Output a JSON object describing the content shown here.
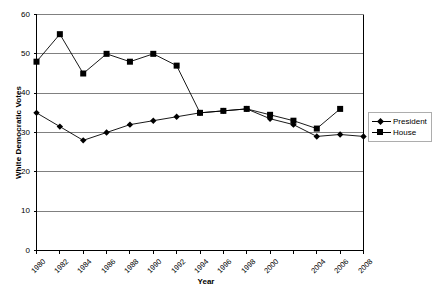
{
  "chart_data": {
    "type": "line",
    "title": "",
    "xlabel": "Year",
    "ylabel": "White Democratic Votes",
    "xlim": [
      1980,
      2008
    ],
    "ylim": [
      0,
      60
    ],
    "ytick_step": 10,
    "yticks": [
      0,
      10,
      20,
      30,
      40,
      50,
      60
    ],
    "grid": "horizontal",
    "legend_position": "right",
    "x": [
      1980,
      1982,
      1984,
      1986,
      1988,
      1990,
      1992,
      1994,
      1996,
      1998,
      2000,
      2002,
      2004,
      2006,
      2008
    ],
    "xticklabels": [
      "1980",
      "1982",
      "1984",
      "1986",
      "1988",
      "1990",
      "1992",
      "1994",
      "1996",
      "1998",
      "2000",
      "",
      "2004",
      "2006",
      "2008"
    ],
    "series": [
      {
        "name": "President",
        "marker": "diamond",
        "values": [
          35,
          31.5,
          28,
          30,
          32,
          33,
          34,
          35,
          35.5,
          36,
          33.5,
          32,
          29,
          29.5,
          29
        ]
      },
      {
        "name": "House",
        "marker": "square",
        "values": [
          48,
          55,
          45,
          50,
          48,
          50,
          47,
          35,
          35.5,
          36,
          34.5,
          33,
          31,
          36,
          null
        ]
      }
    ],
    "yticklabels": [
      "0",
      "10",
      "20",
      "30",
      "40",
      "50",
      "60"
    ]
  },
  "legend": {
    "items": [
      {
        "label": "President"
      },
      {
        "label": "House"
      }
    ]
  },
  "caption": {
    "sliver_text": ""
  }
}
